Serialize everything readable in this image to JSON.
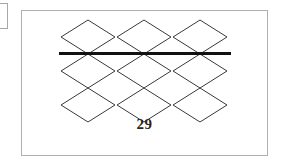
{
  "figure": {
    "caption": "29",
    "frame": {
      "x": 21,
      "y": 10,
      "width": 247,
      "height": 146,
      "border_color": "#b0b0b0"
    },
    "background": "#ffffff",
    "stroke_color": "#3a3a3a",
    "stroke_width": 1,
    "rule": {
      "name": "horizontal-rule",
      "x1": 37,
      "x2": 209,
      "y": 42,
      "thickness": 3,
      "color": "#111111"
    },
    "lattice": {
      "description": "three-by-three arrangement of rhombi; top row sits above a heavy horizontal rule, two lower rows interlock at their vertices",
      "columns": 3,
      "rows": 3,
      "rhombus_width": 54,
      "rhombus_height": 34,
      "column_centers": [
        66,
        122,
        178
      ],
      "row_centers": [
        26,
        60,
        94
      ],
      "row_labels": [
        "top-row",
        "middle-row",
        "bottom-row"
      ]
    },
    "rhombi": [
      {
        "id": "rhombus-r1c1",
        "cx": 66,
        "cy": 26,
        "rx": 27,
        "ry": 17
      },
      {
        "id": "rhombus-r1c2",
        "cx": 122,
        "cy": 26,
        "rx": 27,
        "ry": 17
      },
      {
        "id": "rhombus-r1c3",
        "cx": 178,
        "cy": 26,
        "rx": 27,
        "ry": 17
      },
      {
        "id": "rhombus-r2c1",
        "cx": 66,
        "cy": 60,
        "rx": 27,
        "ry": 17
      },
      {
        "id": "rhombus-r2c2",
        "cx": 122,
        "cy": 60,
        "rx": 27,
        "ry": 17
      },
      {
        "id": "rhombus-r2c3",
        "cx": 178,
        "cy": 60,
        "rx": 27,
        "ry": 17
      },
      {
        "id": "rhombus-r3c1",
        "cx": 66,
        "cy": 94,
        "rx": 27,
        "ry": 17
      },
      {
        "id": "rhombus-r3c2",
        "cx": 122,
        "cy": 94,
        "rx": 27,
        "ry": 17
      },
      {
        "id": "rhombus-r3c3",
        "cx": 178,
        "cy": 94,
        "rx": 27,
        "ry": 17
      }
    ]
  },
  "margin_fragment": {
    "name": "margin-box-fragment",
    "border_color": "#a8a8a8"
  }
}
